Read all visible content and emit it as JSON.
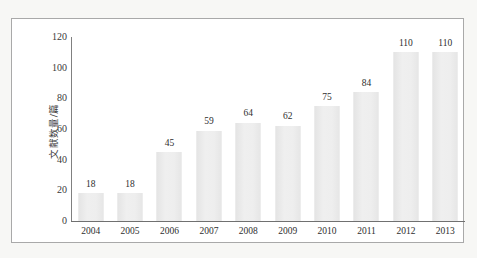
{
  "chart_data": {
    "type": "bar",
    "title": "",
    "subtitle": "",
    "xlabel": "",
    "ylabel": "文献数量/篇",
    "categories": [
      "2004",
      "2005",
      "2006",
      "2007",
      "2008",
      "2009",
      "2010",
      "2011",
      "2012",
      "2013"
    ],
    "values": [
      18,
      18,
      45,
      59,
      64,
      62,
      75,
      84,
      110,
      110
    ],
    "data_labels": [
      "18",
      "18",
      "45",
      "59",
      "64",
      "62",
      "75",
      "84",
      "110",
      "110"
    ],
    "ylim": [
      0,
      120
    ],
    "ytick_labels": [
      "0",
      "20",
      "40",
      "60",
      "80",
      "100",
      "120"
    ],
    "ytick_values": [
      0,
      20,
      40,
      60,
      80,
      100,
      120
    ],
    "grid": false,
    "legend": null,
    "legend_position": "none",
    "series": [
      {
        "name": "文献数量/篇",
        "values": [
          18,
          18,
          45,
          59,
          64,
          62,
          75,
          84,
          110,
          110
        ]
      }
    ],
    "colors": {
      "bar_fill": "#eaeaea",
      "axis_line": "#808080",
      "frame_border": "#a9a9a9",
      "plot_background": "#ffffff",
      "page_background": "#f7f7f5",
      "text": "#2e2e2e"
    }
  }
}
